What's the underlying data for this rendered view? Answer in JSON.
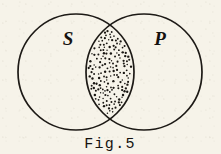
{
  "figure": {
    "kind": "venn-diagram",
    "caption": "Fig.5",
    "background_color": "#f6f3e9",
    "ink_color": "#1d1a16",
    "sets": [
      {
        "id": "subject",
        "label": "S",
        "label_x": 68,
        "label_y": 45,
        "cx": 76,
        "cy": 72,
        "r": 58
      },
      {
        "id": "predicate",
        "label": "P",
        "label_x": 160,
        "label_y": 45,
        "cx": 144,
        "cy": 72,
        "r": 58
      }
    ],
    "intersection": {
      "id": "s-and-p",
      "shading": "stippled",
      "dot_count": 168,
      "dot_radius": 0.95,
      "dot_color": "#1a1713"
    },
    "caption_x": 110,
    "caption_y": 148
  }
}
